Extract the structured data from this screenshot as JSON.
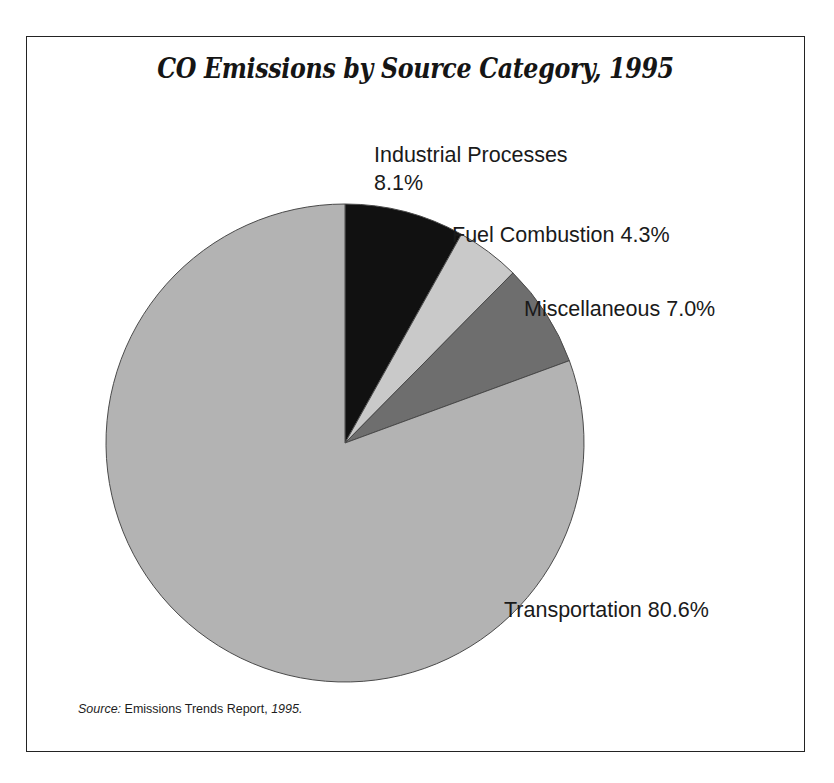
{
  "figure": {
    "title": "CO Emissions by Source Category, 1995",
    "source_prefix": "Source:",
    "source_body": " Emissions Trends Report, ",
    "source_year": "1995."
  },
  "labels": {
    "industrial_line1": "Industrial Processes",
    "industrial_line2": "8.1%",
    "fuel": "Fuel Combustion 4.3%",
    "misc": "Miscellaneous 7.0%",
    "transport": "Transportation 80.6%"
  },
  "chart_data": {
    "type": "pie",
    "title": "CO Emissions by Source Category, 1995",
    "subtitle": "",
    "xlabel": "",
    "ylabel": "",
    "unit": "percent",
    "start_angle_deg": 0,
    "direction": "clockwise",
    "legend": "none (direct labels)",
    "grid": false,
    "categories": [
      "Industrial Processes",
      "Fuel Combustion",
      "Miscellaneous",
      "Transportation"
    ],
    "values": [
      8.1,
      4.3,
      7.0,
      80.6
    ],
    "labels": [
      "Industrial Processes 8.1%",
      "Fuel Combustion 4.3%",
      "Miscellaneous 7.0%",
      "Transportation 80.6%"
    ],
    "colors": [
      "#111111",
      "#c9c9c9",
      "#6e6e6e",
      "#b3b3b3"
    ],
    "slice_edge_color": "#4a4a4a",
    "annotations": [
      "Source: Emissions Trends Report, 1995."
    ]
  },
  "style": {
    "background": "#ffffff",
    "frame_color": "#232323",
    "text_color": "#1a1a1a"
  }
}
